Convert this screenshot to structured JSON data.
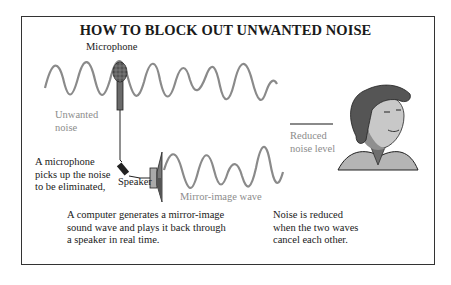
{
  "title": "HOW TO BLOCK OUT UNWANTED NOISE",
  "labels": {
    "microphone": "Microphone",
    "unwanted_noise": "Unwanted\nnoise",
    "speaker": "Speaker",
    "mirror_wave": "Mirror-image wave",
    "reduced_noise": "Reduced\nnoise level"
  },
  "captions": {
    "step1": "A microphone\npicks up the noise\nto be eliminated,",
    "step2": "A computer generates a mirror-image\nsound wave and plays it back through\na speaker in real time.",
    "step3": "Noise is reduced\nwhen the two waves\ncancel each other."
  },
  "colors": {
    "wave": "#8a8a8a",
    "border": "#333333",
    "text": "#1a1a1a",
    "grey_label": "#8c8c8c"
  }
}
